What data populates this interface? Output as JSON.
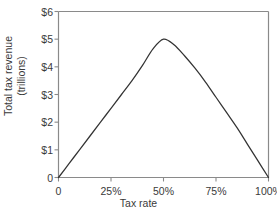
{
  "chart_data": {
    "type": "line",
    "title": "",
    "xlabel": "Tax rate",
    "ylabel": "Total tax revenue (trillions)",
    "ylabel_line1": "Total tax revenue",
    "ylabel_line2": "(trillions)",
    "xlim": [
      0,
      100
    ],
    "ylim": [
      0,
      6
    ],
    "grid": false,
    "legend": null,
    "x_tick_labels": [
      "0",
      "25%",
      "50%",
      "75%",
      "100%"
    ],
    "x_tick_values": [
      0,
      25,
      50,
      75,
      100
    ],
    "y_tick_labels": [
      "0",
      "$1",
      "$2",
      "$3",
      "$4",
      "$5",
      "$6"
    ],
    "y_tick_values": [
      0,
      1,
      2,
      3,
      4,
      5,
      6
    ],
    "series": [
      {
        "name": "Laffer curve",
        "color": "#333333",
        "x": [
          0,
          5,
          10,
          15,
          20,
          25,
          30,
          35,
          40,
          45,
          50,
          55,
          60,
          65,
          70,
          75,
          80,
          85,
          90,
          95,
          100
        ],
        "y": [
          0.0,
          0.5,
          1.0,
          1.5,
          2.0,
          2.5,
          3.0,
          3.5,
          4.05,
          4.65,
          5.0,
          4.8,
          4.4,
          3.95,
          3.45,
          2.9,
          2.35,
          1.8,
          1.2,
          0.6,
          0.0
        ]
      }
    ],
    "annotations": [
      {
        "label": "peak",
        "x": 50,
        "y": 5
      }
    ]
  },
  "style": {
    "axis_color": "#8a8a8a",
    "curve_color": "#333333",
    "text_color": "#3a3a3a",
    "background": "#ffffff"
  }
}
